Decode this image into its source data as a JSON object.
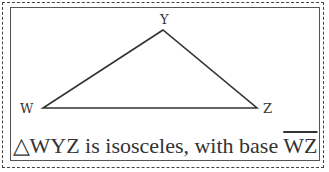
{
  "diagram": {
    "vertices": [
      {
        "name": "Y",
        "x": 163,
        "y": 30,
        "label_x": 167,
        "label_y": 22
      },
      {
        "name": "W",
        "x": 43,
        "y": 108,
        "label_x": 20,
        "label_y": 113
      },
      {
        "name": "Z",
        "x": 257,
        "y": 108,
        "label_x": 264,
        "label_y": 113
      }
    ],
    "caption": {
      "triangle_symbol": "△",
      "triangle_name": "WYZ",
      "text": " is isosceles, with base ",
      "base_segment": "WZ"
    }
  }
}
